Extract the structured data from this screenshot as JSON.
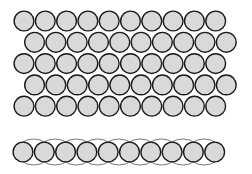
{
  "diagram": {
    "colors": {
      "background": "#ffffff",
      "circle_fill": "#d9d9d9",
      "circle_stroke": "#1a1a1a",
      "ellipse_stroke": "#555555"
    },
    "packed_block": {
      "rows": 5,
      "circles_per_row": 10,
      "diameter": 21,
      "spacing": 21.3,
      "row_pitch": 21.3,
      "first_center_x": 24,
      "first_center_y": 21,
      "odd_row_offset_x": 10.6
    },
    "linear_row": {
      "circles": 10,
      "diameter": 21,
      "spacing": 21.3,
      "first_center_x": 23,
      "center_y": 152,
      "ellipse_count": 9,
      "ellipse_rx": 17,
      "ellipse_ry": 13
    }
  }
}
